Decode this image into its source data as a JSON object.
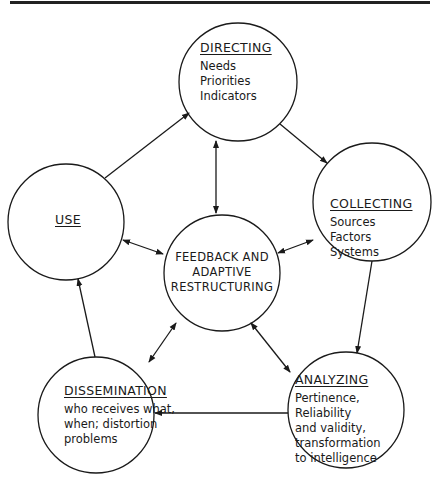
{
  "diagram": {
    "nodes": {
      "directing": {
        "title": "DIRECTING",
        "lines": [
          "Needs",
          "Priorities",
          "Indicators"
        ]
      },
      "collecting": {
        "title": "COLLECTING",
        "lines": [
          "Sources",
          "Factors",
          "Systems"
        ]
      },
      "analyzing": {
        "title": "ANALYZING",
        "lines": [
          "Pertinence,",
          "Reliability",
          "and validity,",
          "transformation",
          "to intelligence"
        ]
      },
      "dissemination": {
        "title": "DISSEMINATION",
        "lines": [
          "who receives what,",
          "when; distortion",
          "problems"
        ]
      },
      "use": {
        "title": "USE"
      },
      "center": {
        "lines": [
          "FEEDBACK AND",
          "ADAPTIVE",
          "RESTRUCTURING"
        ]
      }
    },
    "edges": [
      {
        "from": "directing",
        "to": "collecting",
        "direction": "forward"
      },
      {
        "from": "collecting",
        "to": "analyzing",
        "direction": "forward"
      },
      {
        "from": "analyzing",
        "to": "dissemination",
        "direction": "forward"
      },
      {
        "from": "dissemination",
        "to": "use",
        "direction": "forward"
      },
      {
        "from": "use",
        "to": "directing",
        "direction": "forward"
      },
      {
        "from": "center",
        "to": "directing",
        "direction": "both"
      },
      {
        "from": "center",
        "to": "collecting",
        "direction": "both"
      },
      {
        "from": "center",
        "to": "analyzing",
        "direction": "both"
      },
      {
        "from": "center",
        "to": "dissemination",
        "direction": "both"
      },
      {
        "from": "center",
        "to": "use",
        "direction": "both"
      }
    ],
    "colors": {
      "stroke": "#1a1a1a",
      "background": "#ffffff"
    }
  }
}
